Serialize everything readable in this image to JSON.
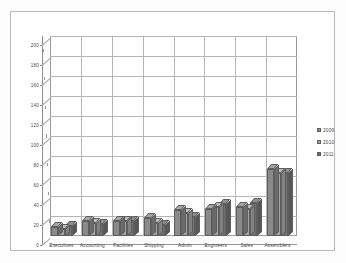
{
  "chart_data": {
    "type": "bar",
    "title": "",
    "subtitle": "",
    "xlabel": "",
    "ylabel": "",
    "ylim": [
      0,
      200
    ],
    "ytick_step": 20,
    "yticks": [
      0,
      20,
      40,
      60,
      80,
      100,
      120,
      140,
      160,
      180,
      200
    ],
    "grid": true,
    "legend_position": "right",
    "style": "3d-clustered-column",
    "categories": [
      "Executives",
      "Accounting",
      "Facilities",
      "Shipping",
      "Admin",
      "Engineers",
      "Sales",
      "Assemblers"
    ],
    "series": [
      {
        "name": "2009",
        "color": "#8a8a8a",
        "values": [
          9,
          15,
          15,
          18,
          26,
          27,
          29,
          67
        ]
      },
      {
        "name": "2010",
        "color": "#a3a3a3",
        "values": [
          7,
          13,
          15,
          13,
          23,
          29,
          27,
          63
        ]
      },
      {
        "name": "2011",
        "color": "#6e6e6e",
        "values": [
          10,
          12,
          15,
          11,
          19,
          32,
          33,
          63
        ]
      }
    ]
  },
  "legend": {
    "items": [
      {
        "label": "2009"
      },
      {
        "label": "2010"
      },
      {
        "label": "2011"
      }
    ]
  },
  "colors": {
    "series_2009": "#8a8a8a",
    "series_2010": "#a3a3a3",
    "series_2011": "#6e6e6e",
    "gridline": "#b5b5b5",
    "axis": "#8d8d8d",
    "frame": "#b9b9b9",
    "plot_background": "#ffffff",
    "page_background": "#fdfdfd"
  }
}
